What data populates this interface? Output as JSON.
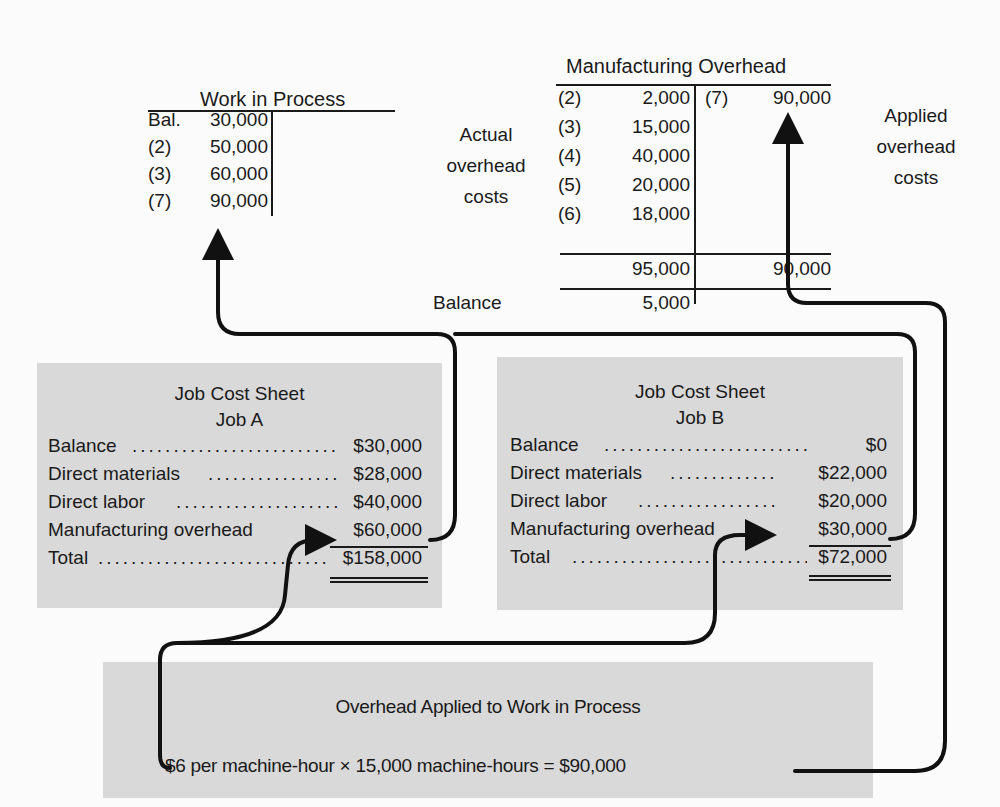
{
  "wip_account": {
    "title": "Work in Process",
    "debits": [
      {
        "ref": "Bal.",
        "amount": "30,000"
      },
      {
        "ref": "(2)",
        "amount": "50,000"
      },
      {
        "ref": "(3)",
        "amount": "60,000"
      },
      {
        "ref": "(7)",
        "amount": "90,000"
      }
    ]
  },
  "moh_account": {
    "title": "Manufacturing Overhead",
    "side_label_actual": "Actual overhead costs",
    "side_label_actual_lines": [
      "Actual",
      "overhead",
      "costs"
    ],
    "side_label_applied_lines": [
      "Applied",
      "overhead",
      "costs"
    ],
    "debits": [
      {
        "ref": "(2)",
        "amount": "2,000"
      },
      {
        "ref": "(3)",
        "amount": "15,000"
      },
      {
        "ref": "(4)",
        "amount": "40,000"
      },
      {
        "ref": "(5)",
        "amount": "20,000"
      },
      {
        "ref": "(6)",
        "amount": "18,000"
      }
    ],
    "credits": [
      {
        "ref": "(7)",
        "amount": "90,000"
      }
    ],
    "debit_total": "95,000",
    "credit_total": "90,000",
    "balance_label": "Balance",
    "balance": "5,000"
  },
  "job_a": {
    "title": "Job Cost Sheet",
    "subtitle": "Job A",
    "rows": [
      {
        "label": "Balance",
        "amount": "$30,000"
      },
      {
        "label": "Direct materials",
        "amount": "$28,000"
      },
      {
        "label": "Direct labor",
        "amount": "$40,000"
      },
      {
        "label": "Manufacturing overhead",
        "amount": "$60,000"
      },
      {
        "label": "Total",
        "amount": "$158,000"
      }
    ]
  },
  "job_b": {
    "title": "Job Cost Sheet",
    "subtitle": "Job B",
    "rows": [
      {
        "label": "Balance",
        "amount": "$0"
      },
      {
        "label": "Direct materials",
        "amount": "$22,000"
      },
      {
        "label": "Direct labor",
        "amount": "$20,000"
      },
      {
        "label": "Manufacturing overhead",
        "amount": "$30,000"
      },
      {
        "label": "Total",
        "amount": "$72,000"
      }
    ]
  },
  "applied_box": {
    "title": "Overhead Applied to Work in Process",
    "formula": "$6 per machine-hour × 15,000 machine-hours = $90,000"
  },
  "colors": {
    "box_fill": "#d9d9d9",
    "ink": "#1a1a1a",
    "page": "#fbfbfb"
  },
  "dots": "............................................................"
}
